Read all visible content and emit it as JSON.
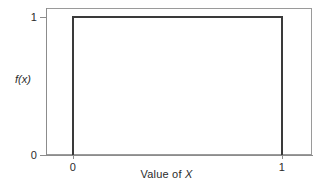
{
  "figure": {
    "background_color": "#ffffff",
    "frame_color": "#9a9a9a",
    "axis_color": "#8c8c8c",
    "curve_color": "#3a3a3a"
  },
  "axes": {
    "y": {
      "title": "f(x)",
      "ticks": [
        {
          "label": "0",
          "value": 0
        },
        {
          "label": "1",
          "value": 1
        }
      ]
    },
    "x": {
      "title_prefix": "Value of ",
      "title_variable": "X",
      "title_full": "Value of X",
      "ticks": [
        {
          "label": "0",
          "value": 0
        },
        {
          "label": "1",
          "value": 1
        }
      ]
    }
  },
  "chart_data": {
    "type": "line",
    "title": "",
    "subtitle": "",
    "xlabel": "Value of X",
    "ylabel": "f(x)",
    "xlim": [
      -0.13,
      1.14
    ],
    "ylim": [
      0,
      1.115
    ],
    "xticks": [
      0,
      1
    ],
    "xticklabels": [
      "0",
      "1"
    ],
    "yticks": [
      0,
      1
    ],
    "yticklabels": [
      "0",
      "1"
    ],
    "grid": false,
    "legend": null,
    "series": [
      {
        "name": "f(x) uniform(0,1) density",
        "color": "#3a3a3a",
        "x": [
          0,
          0,
          1,
          1
        ],
        "y": [
          0,
          1,
          1,
          0
        ]
      }
    ],
    "annotations": []
  }
}
